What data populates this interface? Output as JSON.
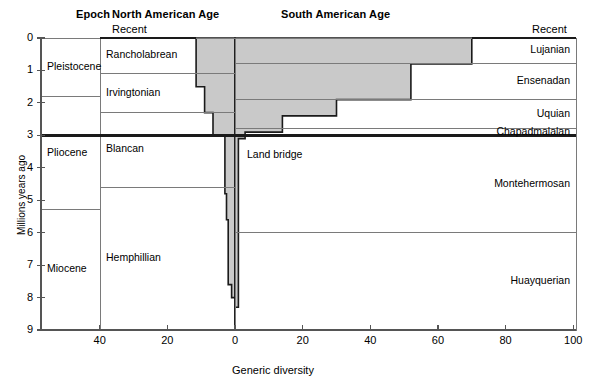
{
  "headers": {
    "epoch": "Epoch",
    "north_american_age": "North American Age",
    "south_american_age": "South American Age"
  },
  "corner_labels": {
    "recent_left": "Recent",
    "recent_right": "Recent"
  },
  "annotations": {
    "land_bridge": "Land bridge"
  },
  "axes": {
    "ylabel": "Millions years ago",
    "xlabel": "Generic diversity",
    "yticks": [
      "0",
      "1",
      "2",
      "3",
      "4",
      "5",
      "6",
      "7",
      "8",
      "9"
    ],
    "xticks": [
      "40",
      "20",
      "0",
      "20",
      "40",
      "60",
      "80",
      "100"
    ]
  },
  "epochs": [
    {
      "name": "Pleistocene",
      "top_ma": 0.0,
      "bottom_ma": 1.8
    },
    {
      "name": "Pliocene",
      "top_ma": 1.8,
      "bottom_ma": 5.3
    },
    {
      "name": "Miocene",
      "top_ma": 5.3,
      "bottom_ma": 9.0
    }
  ],
  "north_american_ages": [
    {
      "name": "Rancholabrean",
      "top_ma": 0.0,
      "bottom_ma": 1.1
    },
    {
      "name": "Irvingtonian",
      "top_ma": 1.1,
      "bottom_ma": 2.3
    },
    {
      "name": "Blancan",
      "top_ma": 2.3,
      "bottom_ma": 4.6
    },
    {
      "name": "Hemphillian",
      "top_ma": 4.6,
      "bottom_ma": 9.0
    }
  ],
  "south_american_ages": [
    {
      "name": "Lujanian",
      "top_ma": 0.0,
      "bottom_ma": 0.8
    },
    {
      "name": "Ensenadan",
      "top_ma": 0.8,
      "bottom_ma": 1.9
    },
    {
      "name": "Uquian",
      "top_ma": 1.9,
      "bottom_ma": 2.8
    },
    {
      "name": "Chapadmalalan",
      "top_ma": 2.8,
      "bottom_ma": 3.0
    },
    {
      "name": "Montehermosan",
      "top_ma": 3.0,
      "bottom_ma": 6.0
    },
    {
      "name": "Huayquerian",
      "top_ma": 6.0,
      "bottom_ma": 9.0
    }
  ],
  "land_bridge_ma": 3.0,
  "colors": {
    "fill": "#c9c9c9",
    "outline": "#1a1a1a",
    "gridline": "#7a7a7a",
    "axis": "#555555",
    "background": "#ffffff"
  },
  "chart_data": {
    "type": "bar",
    "title": "",
    "subtitle": "",
    "xlabel": "Generic diversity",
    "ylabel": "Millions years ago",
    "orientation": "horizontal-bidirectional",
    "ylim": [
      0,
      9
    ],
    "y_inverted": true,
    "xlim_left": [
      0,
      48
    ],
    "xlim_right": [
      0,
      107
    ],
    "grid": false,
    "legend": null,
    "note": "Back-to-back step profile of generic diversity through time. Left series = North American immigrant genera in South America; right series = South American genera. Values read off the 'Generic diversity' axis which runs 40-20-0 to the left of centre and 0-20-40-60-80-100 to the right.",
    "series": [
      {
        "name": "North American side (left of zero)",
        "direction": "left",
        "steps": [
          {
            "top_ma": 0.0,
            "bottom_ma": 1.5,
            "value": 11.5
          },
          {
            "top_ma": 1.5,
            "bottom_ma": 2.3,
            "value": 9.0
          },
          {
            "top_ma": 2.3,
            "bottom_ma": 3.0,
            "value": 6.5
          },
          {
            "top_ma": 3.0,
            "bottom_ma": 4.8,
            "value": 3.0
          },
          {
            "top_ma": 4.8,
            "bottom_ma": 5.6,
            "value": 2.5
          },
          {
            "top_ma": 5.6,
            "bottom_ma": 7.6,
            "value": 2.0
          },
          {
            "top_ma": 7.6,
            "bottom_ma": 8.0,
            "value": 1.0
          },
          {
            "top_ma": 8.0,
            "bottom_ma": 9.0,
            "value": 0.0
          }
        ]
      },
      {
        "name": "South American side (right of zero)",
        "direction": "right",
        "steps": [
          {
            "top_ma": 0.0,
            "bottom_ma": 0.8,
            "value": 70.0
          },
          {
            "top_ma": 0.8,
            "bottom_ma": 1.9,
            "value": 52.0
          },
          {
            "top_ma": 1.9,
            "bottom_ma": 2.4,
            "value": 30.0
          },
          {
            "top_ma": 2.4,
            "bottom_ma": 2.9,
            "value": 14.0
          },
          {
            "top_ma": 2.9,
            "bottom_ma": 3.1,
            "value": 3.0
          },
          {
            "top_ma": 3.1,
            "bottom_ma": 8.3,
            "value": 1.0
          },
          {
            "top_ma": 8.3,
            "bottom_ma": 9.0,
            "value": 0.0
          }
        ]
      }
    ],
    "annotations": [
      {
        "text": "Land bridge",
        "at_ma": 3.0,
        "style": "thick-horizontal-rule"
      }
    ]
  }
}
